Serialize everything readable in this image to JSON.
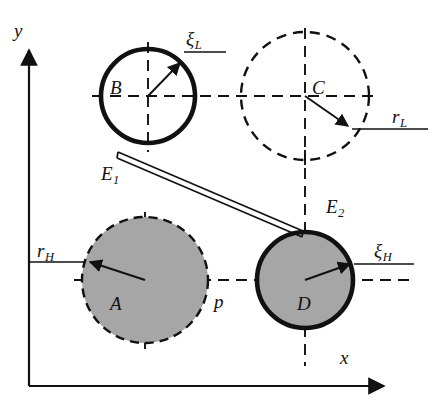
{
  "figure": {
    "type": "mechanism-kinematic-diagram",
    "colors": {
      "stroke": "#111111",
      "fill_gray": "#a6a6a6",
      "background": "#ffffff"
    }
  },
  "axes": {
    "x_label": "x",
    "y_label": "y",
    "origin": {
      "x": 29,
      "y": 386
    }
  },
  "circles": [
    {
      "id": "B",
      "label": "B",
      "style": "solid-thick",
      "fill": "none",
      "cx": 148,
      "cy": 96,
      "r": 47,
      "label_x": 110,
      "label_y": 78
    },
    {
      "id": "C",
      "label": "C",
      "style": "dashed",
      "fill": "none",
      "cx": 305,
      "cy": 96,
      "r": 64,
      "label_x": 312,
      "label_y": 78
    },
    {
      "id": "A",
      "label": "A",
      "style": "dashed",
      "fill": "gray",
      "cx": 145,
      "cy": 280,
      "r": 63,
      "label_x": 110,
      "label_y": 294
    },
    {
      "id": "D",
      "label": "D",
      "style": "solid-thick",
      "fill": "gray",
      "cx": 305,
      "cy": 280,
      "r": 48,
      "label_x": 304,
      "label_y": 294
    }
  ],
  "radius_labels": [
    {
      "id": "xi-L",
      "text": "ξ",
      "subscript": "L",
      "x": 186,
      "y": 33
    },
    {
      "id": "r-L",
      "text": "r",
      "subscript": "L",
      "x": 392,
      "y": 111
    },
    {
      "id": "r-H",
      "text": "r",
      "subscript": "H",
      "x": 38,
      "y": 245
    },
    {
      "id": "xi-H",
      "text": "ξ",
      "subscript": "H",
      "x": 376,
      "y": 245
    }
  ],
  "point_labels": [
    {
      "id": "E1",
      "text": "E",
      "subscript": "1",
      "x": 101,
      "y": 168
    },
    {
      "id": "E2",
      "text": "E",
      "subscript": "2",
      "x": 326,
      "y": 201
    }
  ],
  "other_labels": [
    {
      "id": "p",
      "text": "p",
      "x": 215,
      "y": 293
    }
  ]
}
